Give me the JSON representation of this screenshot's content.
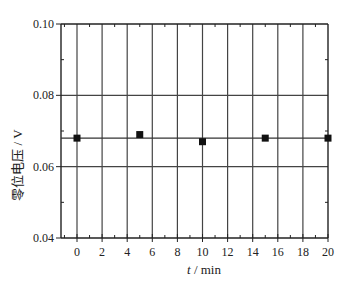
{
  "chart_data": {
    "type": "scatter",
    "title": "",
    "xlabel": "t / min",
    "xlabel_var": "t",
    "xlabel_unit": " / min",
    "ylabel": "零位电压 / V",
    "xlim": [
      -2,
      20
    ],
    "ylim": [
      0.04,
      0.1
    ],
    "x_ticks": [
      0,
      2,
      4,
      6,
      8,
      10,
      12,
      14,
      16,
      18,
      20
    ],
    "x_tick_labels": [
      "0",
      "2",
      "4",
      "6",
      "8",
      "10",
      "12",
      "14",
      "16",
      "18",
      "20"
    ],
    "y_ticks": [
      0.04,
      0.06,
      0.08,
      0.1
    ],
    "y_tick_labels": [
      "0.04",
      "0.06",
      "0.08",
      "0.10"
    ],
    "grid": true,
    "legend": null,
    "series": [
      {
        "name": "零位电压",
        "marker": "square",
        "color": "#111111",
        "x": [
          0,
          5,
          10,
          15,
          20
        ],
        "y": [
          0.068,
          0.069,
          0.067,
          0.068,
          0.068
        ]
      }
    ],
    "reference_line": {
      "y": 0.068,
      "color": "#333333"
    }
  }
}
